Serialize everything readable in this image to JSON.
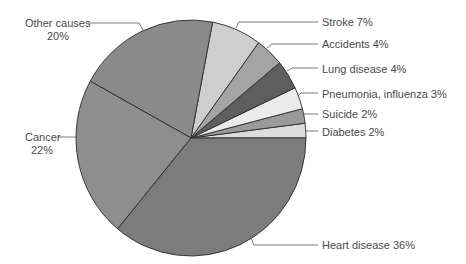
{
  "chart_data": {
    "type": "pie",
    "title": "",
    "start_angle_deg": 0,
    "direction": "counterclockwise",
    "slices": [
      {
        "label": "Diabetes",
        "value": 2,
        "display": "Diabetes  2%",
        "color": "#dcdcdc"
      },
      {
        "label": "Suicide",
        "value": 2,
        "display": "Suicide  2%",
        "color": "#9a9a9a"
      },
      {
        "label": "Pneumonia, influenza",
        "value": 3,
        "display": "Pneumonia, influenza  3%",
        "color": "#ebebeb"
      },
      {
        "label": "Lung disease",
        "value": 4,
        "display": "Lung disease  4%",
        "color": "#5e5e5e"
      },
      {
        "label": "Accidents",
        "value": 4,
        "display": "Accidents  4%",
        "color": "#a4a4a4"
      },
      {
        "label": "Stroke",
        "value": 7,
        "display": "Stroke  7%",
        "color": "#cecece"
      },
      {
        "label": "Other causes",
        "value": 20,
        "display_line1": "Other causes",
        "display_line2": "20%",
        "color": "#8a8a8a"
      },
      {
        "label": "Cancer",
        "value": 22,
        "display_line1": "Cancer",
        "display_line2": "22%",
        "color": "#8e8e8e"
      },
      {
        "label": "Heart disease",
        "value": 36,
        "display": "Heart disease  36%",
        "color": "#7c7c7c"
      }
    ]
  },
  "labels": {
    "stroke": "Stroke  7%",
    "accidents": "Accidents  4%",
    "lung": "Lung disease  4%",
    "pneumonia": "Pneumonia, influenza  3%",
    "suicide": "Suicide  2%",
    "diabetes": "Diabetes  2%",
    "heart": "Heart disease  36%",
    "other_line1": "Other causes",
    "other_line2": "20%",
    "cancer_line1": "Cancer",
    "cancer_line2": "22%"
  }
}
